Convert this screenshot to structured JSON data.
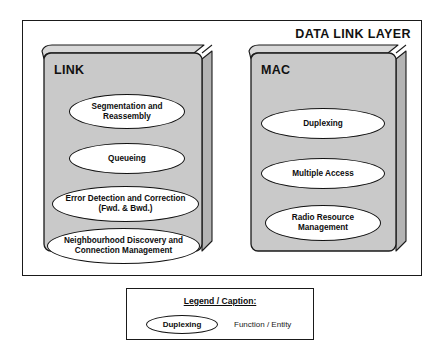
{
  "diagram": {
    "title": "DATA LINK LAYER",
    "sublayers": [
      {
        "name": "LINK",
        "functions": [
          {
            "label": "Segmentation and Reassembly"
          },
          {
            "label": "Queueing"
          },
          {
            "label": "Error Detection and Correction (Fwd. & Bwd.)"
          },
          {
            "label": "Neighbourhood Discovery and Connection Management"
          }
        ]
      },
      {
        "name": "MAC",
        "functions": [
          {
            "label": "Duplexing"
          },
          {
            "label": "Multiple Access"
          },
          {
            "label": "Radio Resource Management"
          }
        ]
      }
    ]
  },
  "legend": {
    "title": "Legend / Caption:",
    "sample_label": "Duplexing",
    "sample_description": "Function / Entity"
  },
  "colors": {
    "box_face": "#c9c9c9",
    "box_top": "#d8d8d8",
    "box_side": "#b4b4b4",
    "outline": "#1a1a1a",
    "ellipse_fill": "#ffffff",
    "background": "#ffffff"
  }
}
